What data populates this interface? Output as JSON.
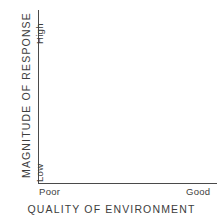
{
  "chart_data": {
    "type": "line",
    "title": "",
    "subtitle": "",
    "xlabel": "QUALITY OF ENVIRONMENT",
    "ylabel": "MAGNITUDE OF RESPONSE",
    "x_tick_labels": [
      "Poor",
      "Good"
    ],
    "y_tick_labels": [
      "Low",
      "High"
    ],
    "x": [],
    "values": [],
    "series": [],
    "annotations": [],
    "legend": [],
    "legend_position": "none",
    "grid": false,
    "xlim": [
      "Poor",
      "Good"
    ],
    "ylim": [
      "Low",
      "High"
    ],
    "axis_style": "L-shaped (left and bottom spines only)",
    "note": "Schematic conceptual axes with no plotted data series",
    "colors": {
      "background": "#ffffff",
      "axis_line": "#4a4a4a",
      "text": "#3d3d3d"
    }
  },
  "axes": {
    "y": {
      "title": "MAGNITUDE OF RESPONSE",
      "high_label": "High",
      "low_label": "Low"
    },
    "x": {
      "title": "QUALITY OF ENVIRONMENT",
      "poor_label": "Poor",
      "good_label": "Good"
    }
  }
}
